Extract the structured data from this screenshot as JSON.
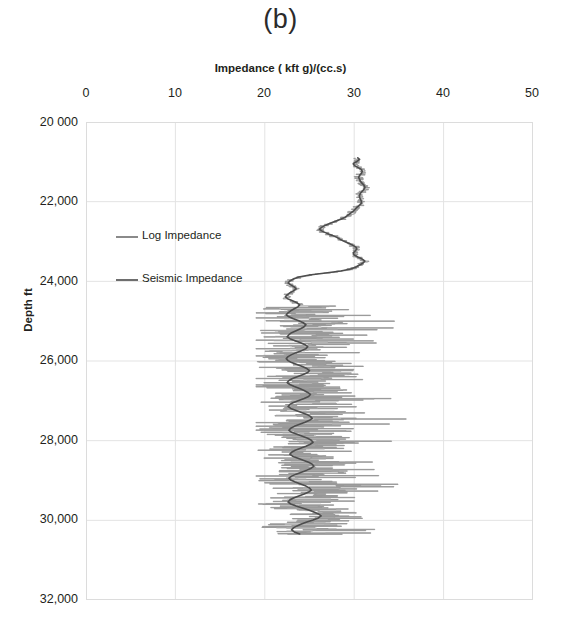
{
  "panel": {
    "title": "(b)"
  },
  "axes": {
    "x_title": "Impedance ( kft g)/(cc.s)",
    "y_title": "Depth ft",
    "x_ticks": [
      "0",
      "10",
      "20",
      "30",
      "40",
      "50"
    ],
    "y_ticks": [
      "20 000",
      "22,000",
      "24,000",
      "26,000",
      "28,000",
      "30,000",
      "32,000"
    ]
  },
  "legend": {
    "items": [
      {
        "label": "Log Impedance",
        "color": "#8a8a8a"
      },
      {
        "label": "Seismic Impedance",
        "color": "#5f5f5f"
      }
    ]
  },
  "chart_data": {
    "type": "line",
    "title": "(b)",
    "xlabel": "Impedance ( kft g)/(cc.s)",
    "ylabel": "Depth ft",
    "xlim": [
      0,
      50
    ],
    "ylim": [
      20000,
      32000
    ],
    "y_inverted": true,
    "grid": true,
    "legend_position": "inside-left",
    "x_tick_values": [
      0,
      10,
      20,
      30,
      40,
      50
    ],
    "y_tick_values": [
      20000,
      22000,
      24000,
      26000,
      28000,
      30000,
      32000
    ],
    "series": [
      {
        "name": "Seismic Impedance",
        "color": "#4d4d4d",
        "linewidth": 1.6,
        "x": [
          30.4,
          30.6,
          30.3,
          29.9,
          30.0,
          30.4,
          30.8,
          30.9,
          30.8,
          30.6,
          30.5,
          30.6,
          30.7,
          30.9,
          31.1,
          31.2,
          31.1,
          30.9,
          30.7,
          30.6,
          30.6,
          30.7,
          30.8,
          30.8,
          30.6,
          30.3,
          30.1,
          29.9,
          29.6,
          29.3,
          29.0,
          28.5,
          27.9,
          27.3,
          26.8,
          26.4,
          26.1,
          26.4,
          26.9,
          27.5,
          28.0,
          28.4,
          28.8,
          29.3,
          29.8,
          30.2,
          30.3,
          30.1,
          29.9,
          30.0,
          30.4,
          30.9,
          31.2,
          31.0,
          30.6,
          30.2,
          29.6,
          28.5,
          26.8,
          25.0,
          23.8,
          23.2,
          22.8,
          22.6,
          22.9,
          23.3,
          23.5,
          23.2,
          22.8,
          22.5,
          22.3,
          22.6,
          23.1,
          23.6,
          23.9,
          23.7,
          23.3,
          22.9,
          22.6,
          22.4,
          22.7,
          23.2,
          23.8,
          24.3,
          24.6,
          24.4,
          24.0,
          23.5,
          23.0,
          22.7,
          22.5,
          22.8,
          23.4,
          24.0,
          24.5,
          24.8,
          24.6,
          24.1,
          23.5,
          23.0,
          22.6,
          22.4,
          22.6,
          23.0,
          23.6,
          24.2,
          24.7,
          25.0,
          24.8,
          24.3,
          23.7,
          23.1,
          22.7,
          22.5,
          22.8,
          23.3,
          23.9,
          24.4,
          24.8,
          25.1,
          24.9,
          24.4,
          23.8,
          23.2,
          22.8,
          22.6,
          22.9,
          23.5,
          24.1,
          24.7,
          25.1,
          25.3,
          25.0,
          24.5,
          23.9,
          23.3,
          22.9,
          22.7,
          23.0,
          23.6,
          24.2,
          24.8,
          25.2,
          25.4,
          25.1,
          24.6,
          24.0,
          23.4,
          23.0,
          22.8,
          23.1,
          23.7,
          24.3,
          24.9,
          25.3,
          25.5,
          25.2,
          24.7,
          24.1,
          23.5,
          23.0,
          22.7,
          22.9,
          23.4,
          24.0,
          24.6,
          25.0,
          25.2,
          24.9,
          24.4,
          23.8,
          23.2,
          22.8,
          22.6,
          22.9,
          23.5,
          24.2,
          24.9,
          25.5,
          26.0,
          26.3,
          26.0,
          25.4,
          24.7,
          24.1,
          23.6,
          23.2,
          23.0,
          23.3,
          23.9,
          24.6,
          25.3,
          25.9,
          26.3,
          26.5,
          26.2,
          25.6,
          24.9,
          24.3,
          23.8,
          23.4,
          23.2,
          23.5,
          24.1,
          24.8,
          25.5,
          26.1,
          26.5,
          26.7,
          26.4,
          25.8,
          25.1,
          24.5,
          24.0,
          23.7,
          23.6,
          24.0,
          24.7,
          25.5,
          26.3,
          26.9,
          27.3,
          27.4,
          27.0,
          26.3,
          25.6,
          25.0,
          24.6,
          24.4,
          24.6,
          25.1,
          25.8,
          26.5,
          27.1,
          27.5,
          27.6,
          27.3,
          26.7,
          26.0,
          25.4,
          25.0,
          24.8,
          25.1,
          25.7,
          26.4,
          27.1,
          27.7,
          28.1,
          28.2,
          27.9,
          27.3,
          26.6,
          26.0,
          25.6,
          25.4,
          25.7,
          26.3,
          27.0,
          27.7,
          28.3,
          28.7,
          28.8,
          28.5,
          27.9,
          27.2,
          26.6,
          26.2,
          26.0,
          26.3,
          26.9,
          27.6,
          28.3,
          28.9,
          29.3,
          29.5,
          29.2,
          28.6,
          28.0,
          27.5,
          27.2,
          27.4,
          28.0,
          28.7,
          29.4,
          30.0,
          30.4,
          30.6,
          30.4,
          29.9,
          29.3,
          28.8,
          28.5,
          28.7,
          29.2,
          29.9,
          30.6,
          31.2,
          31.6,
          31.8,
          31.6,
          31.1,
          30.5,
          30.0,
          29.7,
          29.9,
          30.4,
          31.0,
          31.6,
          32.1,
          32.4,
          32.5,
          32.3,
          31.8,
          31.3,
          30.9,
          30.8,
          31.1,
          31.6,
          32.2,
          32.7,
          33.0,
          33.1,
          32.8,
          32.4,
          32.0,
          31.8,
          32.0,
          32.4,
          32.8,
          33.0,
          32.9,
          32.6,
          32.3,
          32.2,
          32.4,
          32.7,
          32.9,
          32.8,
          32.5,
          32.2,
          32.0,
          32.1,
          32.3,
          32.4,
          32.3,
          32.1
        ],
        "y": [
          20900,
          20940,
          20990,
          21040,
          21090,
          21140,
          21190,
          21240,
          21290,
          21340,
          21390,
          21440,
          21490,
          21540,
          21590,
          21640,
          21690,
          21740,
          21790,
          21840,
          21890,
          21940,
          21990,
          22040,
          22090,
          22140,
          22190,
          22240,
          22290,
          22340,
          22390,
          22440,
          22490,
          22540,
          22590,
          22640,
          22690,
          22740,
          22790,
          22840,
          22890,
          22940,
          22990,
          23040,
          23090,
          23140,
          23190,
          23240,
          23290,
          23340,
          23390,
          23440,
          23490,
          23540,
          23590,
          23640,
          23690,
          23740,
          23790,
          23840,
          23890,
          23940,
          23990,
          24040,
          24090,
          24140,
          24190,
          24240,
          24290,
          24340,
          24390,
          24440,
          24490,
          24540,
          24590,
          24640,
          24690,
          24740,
          24790,
          24840,
          24890,
          24940,
          24990,
          25040,
          25090,
          25140,
          25190,
          25240,
          25290,
          25340,
          25390,
          25440,
          25490,
          25540,
          25590,
          25640,
          25690,
          25740,
          25790,
          25840,
          25890,
          25940,
          25990,
          26040,
          26090,
          26140,
          26190,
          26240,
          26290,
          26340,
          26390,
          26440,
          26490,
          26540,
          26590,
          26640,
          26690,
          26740,
          26790,
          26840,
          26890,
          26940,
          26990,
          27040,
          27090,
          27140,
          27190,
          27240,
          27290,
          27340,
          27390,
          27440,
          27490,
          27540,
          27590,
          27640,
          27690,
          27740,
          27790,
          27840,
          27890,
          27940,
          27990,
          28040,
          28090,
          28140,
          28190,
          28240,
          28290,
          28340,
          28390,
          28440,
          28490,
          28540,
          28590,
          28640,
          28690,
          28740,
          28790,
          28840,
          28890,
          28940,
          28990,
          29040,
          29090,
          29140,
          29190,
          29240,
          29290,
          29340,
          29390,
          29440,
          29490,
          29540,
          29590,
          29640,
          29690,
          29740,
          29790,
          29840,
          29890,
          29940,
          29990,
          30040,
          30090,
          30140,
          30190,
          30240,
          30290,
          30340,
          30390,
          30440,
          30490,
          30540,
          30590,
          30640,
          30690,
          30740,
          30790,
          30840,
          30890,
          30940,
          30990,
          31040,
          31090,
          31140,
          31190,
          31240,
          31290,
          31340,
          31390,
          31440,
          31490,
          31540,
          31590,
          31640,
          31690,
          31740,
          31790,
          31840,
          31890,
          31940,
          31990,
          32040,
          32090,
          32140,
          32190,
          32240,
          32290,
          32340,
          32390,
          32440,
          32490,
          32540,
          32590,
          32640,
          32690,
          32740,
          32790,
          32840,
          32890,
          32940,
          32990,
          33040,
          33090,
          33140,
          33190,
          33240,
          33290,
          33340,
          33390,
          33440,
          33490,
          33540,
          33590,
          33640,
          33690,
          33740,
          33790,
          33840,
          33890,
          33940,
          33990,
          34040,
          34090,
          34140,
          34190,
          34240,
          34290,
          34340,
          34390,
          34440,
          34490,
          34540,
          34590,
          34640,
          34690,
          34740,
          34790,
          34840,
          34890,
          34940,
          34990,
          35040,
          35090,
          35140,
          35190,
          35240,
          35290,
          35340,
          35390,
          35440,
          35490,
          35540,
          35590,
          35640,
          35690,
          35740,
          35790,
          35840,
          35890,
          35940,
          35990,
          36040,
          36090,
          36140,
          36190,
          36240,
          36290,
          36340,
          36390,
          36440,
          36490,
          36540,
          36590,
          36640,
          36690,
          36740,
          36790,
          36840,
          36890,
          36940,
          36990,
          37040,
          37090,
          37140,
          37190,
          37240,
          37290,
          37340,
          37390,
          37440,
          37490,
          37540,
          37590,
          37640,
          37690,
          37740,
          37790,
          37840,
          37890,
          37940,
          37990,
          38040,
          38090,
          38140
        ]
      },
      {
        "name": "Log Impedance",
        "color": "#999999",
        "linewidth": 1.0,
        "note": "High-frequency well log; spiky excursions from ~19 to ~38 kft g/(cc.s) below 24,600 ft, tightly tracking the seismic trace above that depth.",
        "depth_start": 20900,
        "depth_end": 30350,
        "blocky_start": 24600,
        "spike_min": 19.0,
        "spike_max": 38.0
      }
    ],
    "annotations": [
      {
        "text": "Log and seismic impedance overlay well tie",
        "visible": false
      }
    ]
  }
}
